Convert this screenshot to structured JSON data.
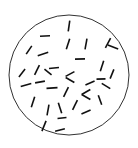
{
  "figure": {
    "type": "scatter",
    "title": "",
    "caption": "",
    "background_color": "#ffffff",
    "ink_color": "#111111",
    "boundary": {
      "shape": "circle",
      "center_x": 69,
      "center_y": 75,
      "radius": 60,
      "stroke_color": "#1a1a1a",
      "stroke_width": 0.9,
      "fill_color": "#ffffff"
    },
    "marks": {
      "kind": "line-segment",
      "count": 35,
      "label": "randomly oriented rods",
      "stroke_width": 1.6,
      "color": "#111111"
    }
  },
  "chart_data": {
    "type": "scatter",
    "title": "",
    "xlabel": "",
    "ylabel": "",
    "xlim": [
      9,
      129
    ],
    "ylim": [
      10,
      140
    ],
    "grid": false,
    "legend": null,
    "boundary_circle": {
      "cx": 69,
      "cy": 75,
      "r": 60
    },
    "segments": [
      {
        "id": 1,
        "x": 69,
        "y": 26,
        "length": 11,
        "angle_deg": 82
      },
      {
        "id": 2,
        "x": 45,
        "y": 36,
        "length": 10,
        "angle_deg": 3
      },
      {
        "id": 3,
        "x": 68,
        "y": 44,
        "length": 11,
        "angle_deg": 72
      },
      {
        "id": 4,
        "x": 86,
        "y": 44,
        "length": 11,
        "angle_deg": 80
      },
      {
        "id": 5,
        "x": 108,
        "y": 43,
        "length": 11,
        "angle_deg": 62
      },
      {
        "id": 6,
        "x": 113,
        "y": 47,
        "length": 11,
        "angle_deg": 160
      },
      {
        "id": 7,
        "x": 29,
        "y": 50,
        "length": 10,
        "angle_deg": 56
      },
      {
        "id": 8,
        "x": 43,
        "y": 54,
        "length": 11,
        "angle_deg": 18
      },
      {
        "id": 9,
        "x": 80,
        "y": 59,
        "length": 10,
        "angle_deg": 2
      },
      {
        "id": 10,
        "x": 102,
        "y": 66,
        "length": 11,
        "angle_deg": 72
      },
      {
        "id": 11,
        "x": 22,
        "y": 73,
        "length": 10,
        "angle_deg": 52
      },
      {
        "id": 12,
        "x": 37,
        "y": 70,
        "length": 11,
        "angle_deg": 64
      },
      {
        "id": 13,
        "x": 48,
        "y": 72,
        "length": 9,
        "angle_deg": 142
      },
      {
        "id": 14,
        "x": 54,
        "y": 68,
        "length": 10,
        "angle_deg": 6
      },
      {
        "id": 15,
        "x": 70,
        "y": 74,
        "length": 10,
        "angle_deg": 28
      },
      {
        "id": 16,
        "x": 70,
        "y": 80,
        "length": 10,
        "angle_deg": 150
      },
      {
        "id": 17,
        "x": 112,
        "y": 74,
        "length": 10,
        "angle_deg": 68
      },
      {
        "id": 18,
        "x": 26,
        "y": 85,
        "length": 11,
        "angle_deg": 16
      },
      {
        "id": 19,
        "x": 40,
        "y": 82,
        "length": 10,
        "angle_deg": 10
      },
      {
        "id": 20,
        "x": 52,
        "y": 88,
        "length": 11,
        "angle_deg": 4
      },
      {
        "id": 21,
        "x": 90,
        "y": 83,
        "length": 10,
        "angle_deg": 24
      },
      {
        "id": 22,
        "x": 101,
        "y": 79,
        "length": 9,
        "angle_deg": 2
      },
      {
        "id": 23,
        "x": 106,
        "y": 86,
        "length": 10,
        "angle_deg": 148
      },
      {
        "id": 24,
        "x": 86,
        "y": 92,
        "length": 10,
        "angle_deg": 30
      },
      {
        "id": 25,
        "x": 86,
        "y": 97,
        "length": 10,
        "angle_deg": 150
      },
      {
        "id": 26,
        "x": 66,
        "y": 92,
        "length": 11,
        "angle_deg": 64
      },
      {
        "id": 27,
        "x": 33,
        "y": 102,
        "length": 11,
        "angle_deg": 72
      },
      {
        "id": 28,
        "x": 48,
        "y": 110,
        "length": 11,
        "angle_deg": 80
      },
      {
        "id": 29,
        "x": 60,
        "y": 108,
        "length": 11,
        "angle_deg": 108
      },
      {
        "id": 30,
        "x": 75,
        "y": 105,
        "length": 11,
        "angle_deg": 64
      },
      {
        "id": 31,
        "x": 86,
        "y": 112,
        "length": 10,
        "angle_deg": 24
      },
      {
        "id": 32,
        "x": 62,
        "y": 118,
        "length": 9,
        "angle_deg": 6
      },
      {
        "id": 33,
        "x": 44,
        "y": 126,
        "length": 11,
        "angle_deg": 68
      },
      {
        "id": 34,
        "x": 60,
        "y": 130,
        "length": 10,
        "angle_deg": 14
      },
      {
        "id": 35,
        "x": 100,
        "y": 100,
        "length": 10,
        "angle_deg": 110
      }
    ]
  }
}
